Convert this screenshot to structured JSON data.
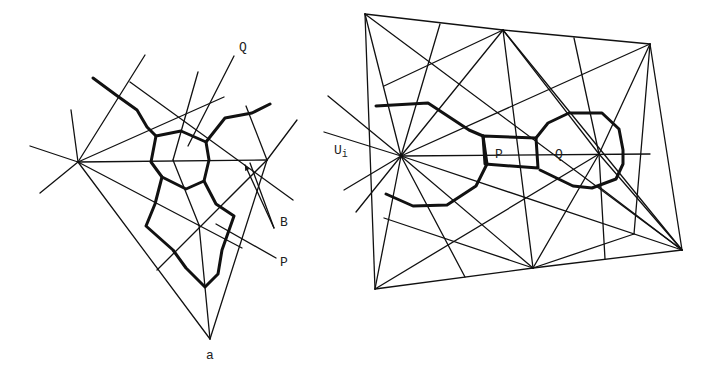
{
  "figure": {
    "left_diagram": {
      "labels": [
        {
          "id": "Q",
          "text": "Q",
          "x": 239,
          "y": 51
        },
        {
          "id": "B",
          "text": "B",
          "x": 280,
          "y": 226
        },
        {
          "id": "P",
          "text": "P",
          "x": 280,
          "y": 266
        },
        {
          "id": "a",
          "text": "a",
          "x": 206,
          "y": 359
        }
      ],
      "thin_lines": [
        [
          78,
          162,
          267,
          160
        ],
        [
          78,
          162,
          210,
          339
        ],
        [
          267,
          160,
          210,
          339
        ],
        [
          78,
          162,
          242,
          248
        ],
        [
          78,
          162,
          224,
          97
        ],
        [
          78,
          162,
          30,
          146
        ],
        [
          78,
          162,
          40,
          193
        ],
        [
          78,
          162,
          71,
          110
        ],
        [
          78,
          162,
          145,
          55
        ],
        [
          130,
          82,
          293,
          200
        ],
        [
          267,
          160,
          297,
          120
        ],
        [
          267,
          160,
          157,
          270
        ],
        [
          267,
          160,
          246,
          106
        ],
        [
          173,
          160,
          198,
          72
        ],
        [
          173,
          160,
          199,
          225
        ],
        [
          199,
          225,
          210,
          339
        ],
        [
          188,
          146,
          234,
          56
        ],
        [
          250,
          163,
          274,
          228
        ],
        [
          216,
          224,
          276,
          258
        ]
      ],
      "arrows": [
        {
          "x1": 274,
          "y1": 228,
          "x2": 245,
          "y2": 165
        }
      ],
      "thick_paths": [
        "M93,78 L116,95 L137,110 L147,127 L156,136",
        "M156,136 L181,131 L206,142 L209,160 L204,181 L186,189 L162,177 L151,162 L156,136",
        "M206,142 L225,118 L252,113 L270,104",
        "M162,177 L155,204 L146,226 L173,250 L186,268 L205,287 L218,274 L222,250 L234,216 L216,204 L204,181"
      ]
    },
    "right_diagram": {
      "labels": [
        {
          "id": "Ui",
          "text": "U",
          "sub": "i",
          "x": 334,
          "y": 154
        },
        {
          "id": "P",
          "text": "P",
          "x": 495,
          "y": 158
        },
        {
          "id": "Q",
          "text": "Q",
          "x": 555,
          "y": 158
        }
      ],
      "thin_lines": [
        [
          365,
          14,
          503,
          30
        ],
        [
          503,
          30,
          650,
          44
        ],
        [
          650,
          44,
          682,
          250
        ],
        [
          682,
          250,
          533,
          268
        ],
        [
          533,
          268,
          375,
          289
        ],
        [
          375,
          289,
          365,
          14
        ],
        [
          365,
          14,
          682,
          250
        ],
        [
          365,
          14,
          401,
          156
        ],
        [
          503,
          30,
          401,
          156
        ],
        [
          503,
          30,
          533,
          268
        ],
        [
          503,
          30,
          599,
          154
        ],
        [
          503,
          30,
          682,
          250
        ],
        [
          503,
          30,
          384,
          86
        ],
        [
          650,
          44,
          599,
          154
        ],
        [
          650,
          44,
          401,
          156
        ],
        [
          650,
          44,
          634,
          234
        ],
        [
          401,
          156,
          682,
          250
        ],
        [
          401,
          156,
          533,
          268
        ],
        [
          401,
          156,
          465,
          277
        ],
        [
          401,
          156,
          375,
          289
        ],
        [
          401,
          156,
          440,
          24
        ],
        [
          401,
          156,
          328,
          96
        ],
        [
          401,
          156,
          324,
          132
        ],
        [
          401,
          156,
          344,
          190
        ],
        [
          401,
          156,
          356,
          212
        ],
        [
          401,
          156,
          650,
          154
        ],
        [
          599,
          154,
          533,
          268
        ],
        [
          599,
          154,
          375,
          289
        ],
        [
          599,
          154,
          605,
          259
        ],
        [
          599,
          154,
          682,
          250
        ],
        [
          599,
          154,
          574,
          38
        ],
        [
          384,
          218,
          533,
          268
        ],
        [
          634,
          234,
          533,
          268
        ],
        [
          598,
          186,
          682,
          250
        ]
      ],
      "thick_paths": [
        "M376,106 L428,103 L469,130 L483,136",
        "M483,136 L536,138 L538,168 L485,164 Z",
        "M483,136 L487,164 L476,186 L447,205 L413,206 L386,194",
        "M536,138 L548,123 L569,113 L602,113 L619,129 L623,150 L623,164 L616,179 L592,188 L573,186 L540,170"
      ]
    }
  }
}
